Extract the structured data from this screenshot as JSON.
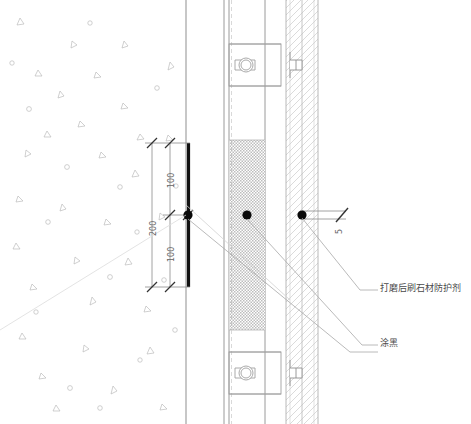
{
  "drawing": {
    "title": "墙身石材干挂节点详图",
    "background_color": "#ffffff",
    "line_color": "#8c8c8c",
    "heavy_line_color": "#111111",
    "hatch_color": "#c8c8c8",
    "text_color": "#4a4a4a"
  },
  "dimensions": {
    "overall": "200",
    "upper_segment": "100",
    "lower_segment": "100",
    "joint_width": "5"
  },
  "annotations": {
    "stone_protectant": "打磨后刷石材防护剂",
    "paint_black": "涂黑"
  },
  "layers": {
    "concrete_wall": "混凝土墙",
    "air_cavity": "空腔",
    "stone_panel": "石材面板",
    "insulation": "保温层"
  },
  "nodes": [
    {
      "name": "joint-node-left",
      "x": 188,
      "y": 215
    },
    {
      "name": "joint-node-middle",
      "x": 247,
      "y": 215
    },
    {
      "name": "joint-node-right",
      "x": 302,
      "y": 215
    }
  ],
  "anchors": [
    {
      "name": "anchor-upper",
      "y": 65
    },
    {
      "name": "anchor-lower",
      "y": 373
    }
  ]
}
